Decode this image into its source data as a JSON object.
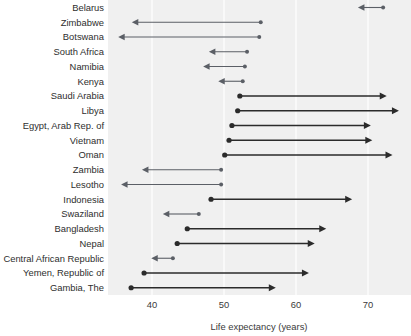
{
  "chart_data": {
    "type": "bar",
    "subtype": "arrow-range-dot-plot",
    "title": "",
    "subtitle": "",
    "xlabel": "Life expectancy (years)",
    "ylabel": "",
    "xlim": [
      34,
      77
    ],
    "xticks": [
      40,
      50,
      60,
      70
    ],
    "xticklabels": [
      "40",
      "50",
      "60",
      "70"
    ],
    "grid": true,
    "grid_axis": "x",
    "legend": "none",
    "plot_bg": "#f0f0f0",
    "grid_color": "#ffffff",
    "arrow_color": "#5b5f66",
    "arrow_color_dark": "#2b2b2b",
    "categories": [
      "Belarus",
      "Zimbabwe",
      "Botswana",
      "South Africa",
      "Namibia",
      "Kenya",
      "Saudi Arabia",
      "Libya",
      "Egypt, Arab Rep. of",
      "Vietnam",
      "Oman",
      "Zambia",
      "Lesotho",
      "Indonesia",
      "Swaziland",
      "Bangladesh",
      "Nepal",
      "Central African Republic",
      "Yemen, Republic of",
      "Gambia, The"
    ],
    "series": [
      {
        "name": "start",
        "values": [
          72.1,
          55.1,
          54.9,
          53.2,
          52.9,
          52.6,
          52.2,
          51.9,
          51.1,
          50.7,
          50.1,
          49.6,
          49.6,
          48.2,
          46.5,
          44.9,
          43.5,
          42.9,
          38.9,
          37.1
        ]
      },
      {
        "name": "end",
        "values": [
          68.6,
          37.2,
          35.3,
          47.9,
          47.1,
          49.2,
          72.6,
          74.3,
          70.4,
          70.6,
          73.4,
          38.6,
          35.7,
          67.8,
          41.5,
          64.2,
          62.6,
          39.9,
          61.8,
          57.2
        ]
      }
    ],
    "points": [
      {
        "label": "Belarus",
        "start": 72.1,
        "end": 68.6,
        "direction": "left",
        "weight": "light"
      },
      {
        "label": "Zimbabwe",
        "start": 55.1,
        "end": 37.2,
        "direction": "left",
        "weight": "light"
      },
      {
        "label": "Botswana",
        "start": 54.9,
        "end": 35.3,
        "direction": "left",
        "weight": "light"
      },
      {
        "label": "South Africa",
        "start": 53.2,
        "end": 47.9,
        "direction": "left",
        "weight": "light"
      },
      {
        "label": "Namibia",
        "start": 52.9,
        "end": 47.1,
        "direction": "left",
        "weight": "light"
      },
      {
        "label": "Kenya",
        "start": 52.6,
        "end": 49.2,
        "direction": "left",
        "weight": "light"
      },
      {
        "label": "Saudi Arabia",
        "start": 52.2,
        "end": 72.6,
        "direction": "right",
        "weight": "dark"
      },
      {
        "label": "Libya",
        "start": 51.9,
        "end": 74.3,
        "direction": "right",
        "weight": "dark"
      },
      {
        "label": "Egypt, Arab Rep. of",
        "start": 51.1,
        "end": 70.4,
        "direction": "right",
        "weight": "dark"
      },
      {
        "label": "Vietnam",
        "start": 50.7,
        "end": 70.6,
        "direction": "right",
        "weight": "dark"
      },
      {
        "label": "Oman",
        "start": 50.1,
        "end": 73.4,
        "direction": "right",
        "weight": "dark"
      },
      {
        "label": "Zambia",
        "start": 49.6,
        "end": 38.6,
        "direction": "left",
        "weight": "light"
      },
      {
        "label": "Lesotho",
        "start": 49.6,
        "end": 35.7,
        "direction": "left",
        "weight": "light"
      },
      {
        "label": "Indonesia",
        "start": 48.2,
        "end": 67.8,
        "direction": "right",
        "weight": "dark"
      },
      {
        "label": "Swaziland",
        "start": 46.5,
        "end": 41.5,
        "direction": "left",
        "weight": "light"
      },
      {
        "label": "Bangladesh",
        "start": 44.9,
        "end": 64.2,
        "direction": "right",
        "weight": "dark"
      },
      {
        "label": "Nepal",
        "start": 43.5,
        "end": 62.6,
        "direction": "right",
        "weight": "dark"
      },
      {
        "label": "Central African Republic",
        "start": 42.9,
        "end": 39.9,
        "direction": "left",
        "weight": "light"
      },
      {
        "label": "Yemen, Republic of",
        "start": 38.9,
        "end": 61.8,
        "direction": "right",
        "weight": "dark"
      },
      {
        "label": "Gambia, The",
        "start": 37.1,
        "end": 57.2,
        "direction": "right",
        "weight": "dark"
      }
    ]
  }
}
